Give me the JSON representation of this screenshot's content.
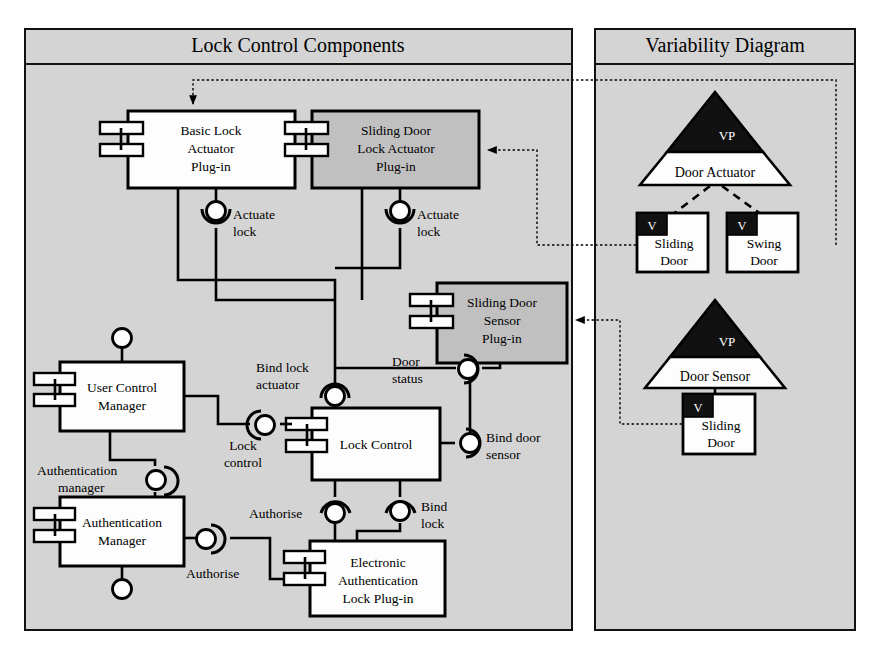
{
  "diagram": {
    "type": "uml-component-variability-diagram",
    "background_color": "#d4d4d4",
    "panels": [
      {
        "id": "lock-control-components",
        "title": "Lock Control Components"
      },
      {
        "id": "variability-diagram",
        "title": "Variability Diagram"
      }
    ]
  },
  "components": [
    {
      "id": "basic-lock-actuator",
      "label_lines": [
        "Basic Lock",
        "Actuator",
        "Plug-in"
      ],
      "fill": "#fdfdfd",
      "variant": false
    },
    {
      "id": "sliding-door-lock-actuator",
      "label_lines": [
        "Sliding Door",
        "Lock Actuator",
        "Plug-in"
      ],
      "fill": "#c0c0c0",
      "variant": true
    },
    {
      "id": "sliding-door-sensor",
      "label_lines": [
        "Sliding Door",
        "Sensor",
        "Plug-in"
      ],
      "fill": "#c0c0c0",
      "variant": true
    },
    {
      "id": "user-control-manager",
      "label_lines": [
        "User Control",
        "Manager"
      ],
      "fill": "#fdfdfd",
      "variant": false
    },
    {
      "id": "lock-control",
      "label_lines": [
        "Lock Control"
      ],
      "fill": "#fdfdfd",
      "variant": false
    },
    {
      "id": "authentication-manager",
      "label_lines": [
        "Authentication",
        "Manager"
      ],
      "fill": "#fdfdfd",
      "variant": false
    },
    {
      "id": "electronic-authentication-lock",
      "label_lines": [
        "Electronic",
        "Authentication",
        "Lock Plug-in"
      ],
      "fill": "#fdfdfd",
      "variant": false
    }
  ],
  "connectors": [
    {
      "id": "actuate-lock-basic",
      "label_lines": [
        "Actuate",
        "lock"
      ]
    },
    {
      "id": "actuate-lock-sliding",
      "label_lines": [
        "Actuate",
        "lock"
      ]
    },
    {
      "id": "bind-lock-actuator",
      "label_lines": [
        "Bind lock",
        "actuator"
      ]
    },
    {
      "id": "door-status",
      "label_lines": [
        "Door",
        "status"
      ]
    },
    {
      "id": "bind-door-sensor",
      "label_lines": [
        "Bind door",
        "sensor"
      ]
    },
    {
      "id": "lock-control-port",
      "label_lines": [
        "Lock",
        "control"
      ]
    },
    {
      "id": "authentication-manager-port",
      "label_lines": [
        "Authentication",
        "manager"
      ]
    },
    {
      "id": "authorise-upper",
      "label_lines": [
        "Authorise"
      ]
    },
    {
      "id": "authorise-lower",
      "label_lines": [
        "Authorise"
      ]
    },
    {
      "id": "bind-lock",
      "label_lines": [
        "Bind",
        "lock"
      ]
    }
  ],
  "variability": {
    "variation_points": [
      {
        "id": "door-actuator",
        "tag": "VP",
        "name": "Door Actuator",
        "variants": [
          {
            "id": "sliding-door-actuator",
            "tag": "V",
            "label_lines": [
              "Sliding",
              "Door"
            ]
          },
          {
            "id": "swing-door-actuator",
            "tag": "V",
            "label_lines": [
              "Swing",
              "Door"
            ]
          }
        ]
      },
      {
        "id": "door-sensor",
        "tag": "VP",
        "name": "Door Sensor",
        "variants": [
          {
            "id": "sliding-door-sensor-variant",
            "tag": "V",
            "label_lines": [
              "Sliding",
              "Door"
            ]
          }
        ]
      }
    ]
  },
  "traces": [
    {
      "from": "swing-door-actuator",
      "to": "basic-lock-actuator"
    },
    {
      "from": "sliding-door-actuator",
      "to": "sliding-door-lock-actuator"
    },
    {
      "from": "sliding-door-sensor-variant",
      "to": "sliding-door-sensor"
    }
  ]
}
